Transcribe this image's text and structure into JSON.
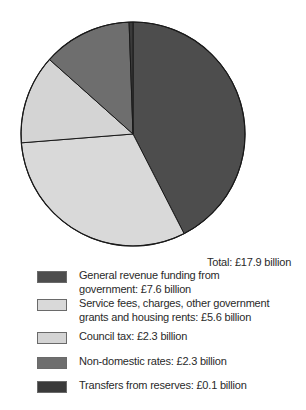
{
  "chart_data": {
    "type": "pie",
    "title": "",
    "total_label": "Total: £17.9 billion",
    "unit": "£ billion",
    "categories": [
      "General revenue funding from government",
      "Service fees, charges, other government grants and housing rents",
      "Council tax",
      "Non-domestic rates",
      "Transfers from reserves"
    ],
    "values": [
      7.6,
      5.6,
      2.3,
      2.3,
      0.1
    ],
    "colors": [
      "#4d4d4d",
      "#d9d9d9",
      "#d4d4d4",
      "#6e6e6e",
      "#3a3a3a"
    ],
    "legend_position": "bottom",
    "start_angle_deg": 0,
    "direction": "clockwise"
  },
  "legend": {
    "items": [
      {
        "label": "General revenue funding from government: £7.6 billion",
        "color": "#4d4d4d"
      },
      {
        "label": "Service fees, charges, other government grants and housing rents: £5.6 billion",
        "color": "#d9d9d9"
      },
      {
        "label": "Council tax: £2.3 billion",
        "color": "#d4d4d4"
      },
      {
        "label": "Non-domestic rates: £2.3 billion",
        "color": "#6e6e6e"
      },
      {
        "label": "Transfers from reserves: £0.1 billion",
        "color": "#3a3a3a"
      }
    ]
  },
  "total": "Total: £17.9 billion"
}
